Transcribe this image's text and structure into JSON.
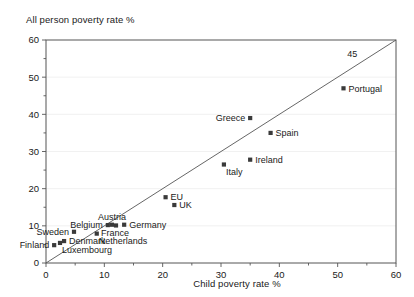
{
  "chart_data": {
    "type": "scatter",
    "title": "",
    "ylabel": "All person poverty rate %",
    "xlabel": "Child poverty rate %",
    "xlim": [
      0,
      60
    ],
    "ylim": [
      0,
      60
    ],
    "xticks": [
      0,
      10,
      20,
      30,
      40,
      50,
      60
    ],
    "yticks": [
      0,
      10,
      20,
      30,
      40,
      50,
      60
    ],
    "xminorticks": [
      5,
      15,
      25,
      35,
      45,
      55
    ],
    "yminorticks": [
      5,
      15,
      25,
      35,
      45,
      55
    ],
    "grid": "horizontal-major-light",
    "legend": "none",
    "reference_line": {
      "label": "45",
      "description": "45 degree line",
      "from": [
        0,
        0
      ],
      "to": [
        60,
        60
      ]
    },
    "points": [
      {
        "name": "Finland",
        "x": 1.4,
        "y": 4.8,
        "label_pos": "left"
      },
      {
        "name": "Luxembourg",
        "x": 2.4,
        "y": 5.4,
        "label_pos": "below-right"
      },
      {
        "name": "Denmark",
        "x": 3.1,
        "y": 5.9,
        "label_pos": "right"
      },
      {
        "name": "Sweden",
        "x": 4.8,
        "y": 8.4,
        "label_pos": "left"
      },
      {
        "name": "Netherlands",
        "x": 8.7,
        "y": 7.9,
        "label_pos": "below-right"
      },
      {
        "name": "Belgium",
        "x": 10.6,
        "y": 10.2,
        "label_pos": "left"
      },
      {
        "name": "Austria",
        "x": 11.3,
        "y": 10.3,
        "label_pos": "above"
      },
      {
        "name": "France",
        "x": 12.0,
        "y": 10.1,
        "label_pos": "below"
      },
      {
        "name": "Germany",
        "x": 13.4,
        "y": 10.3,
        "label_pos": "right"
      },
      {
        "name": "EU",
        "x": 20.5,
        "y": 17.7,
        "label_pos": "right"
      },
      {
        "name": "UK",
        "x": 22.0,
        "y": 15.6,
        "label_pos": "right"
      },
      {
        "name": "Italy",
        "x": 30.5,
        "y": 26.5,
        "label_pos": "below-right"
      },
      {
        "name": "Ireland",
        "x": 35.0,
        "y": 27.8,
        "label_pos": "right"
      },
      {
        "name": "Greece",
        "x": 35.0,
        "y": 39.0,
        "label_pos": "left"
      },
      {
        "name": "Spain",
        "x": 38.5,
        "y": 35.0,
        "label_pos": "right"
      },
      {
        "name": "Portugal",
        "x": 51.0,
        "y": 47.0,
        "label_pos": "right"
      }
    ]
  },
  "colors": {
    "marker": "#3a3a3a",
    "axis": "#555555",
    "grid": "#e8e8e8",
    "text": "#1a1a1a",
    "background": "#ffffff"
  }
}
